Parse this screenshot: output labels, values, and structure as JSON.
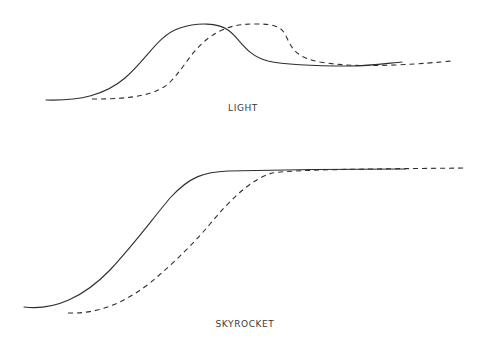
{
  "colors": {
    "background": "#ffffff",
    "line": "#2e2e2e",
    "text": "#3a3a3a"
  },
  "panels": [
    {
      "id": "light",
      "label": "LIGHT",
      "series": [
        {
          "name": "solid-curve",
          "style": "solid",
          "path": "M46,100 C80,101 105,95 125,78 C148,58 158,35 180,28 C198,22 218,23 228,30 C240,38 245,55 268,61 C290,66 330,66 350,66 C370,66 390,63 402,62"
        },
        {
          "name": "dashed-curve",
          "style": "dashed",
          "path": "M92,99 C130,99 158,96 172,80 C186,65 192,50 210,37 C225,26 240,24 255,24 C275,24 282,26 287,38 C293,52 300,58 320,62 C345,66 365,66 395,65 C420,64 440,62 452,61"
        }
      ]
    },
    {
      "id": "skyrocket",
      "label": "SKYROCKET",
      "series": [
        {
          "name": "solid-curve",
          "style": "solid",
          "path": "M24,307 C55,311 85,296 110,270 C135,243 150,222 170,198 C190,176 205,172 228,171 C270,170 350,169 405,169"
        },
        {
          "name": "dashed-curve",
          "style": "dashed",
          "path": "M68,313 C100,314 125,302 150,283 C175,262 195,242 210,224 C230,200 250,180 272,173 C300,169 380,169 466,168"
        }
      ]
    }
  ]
}
